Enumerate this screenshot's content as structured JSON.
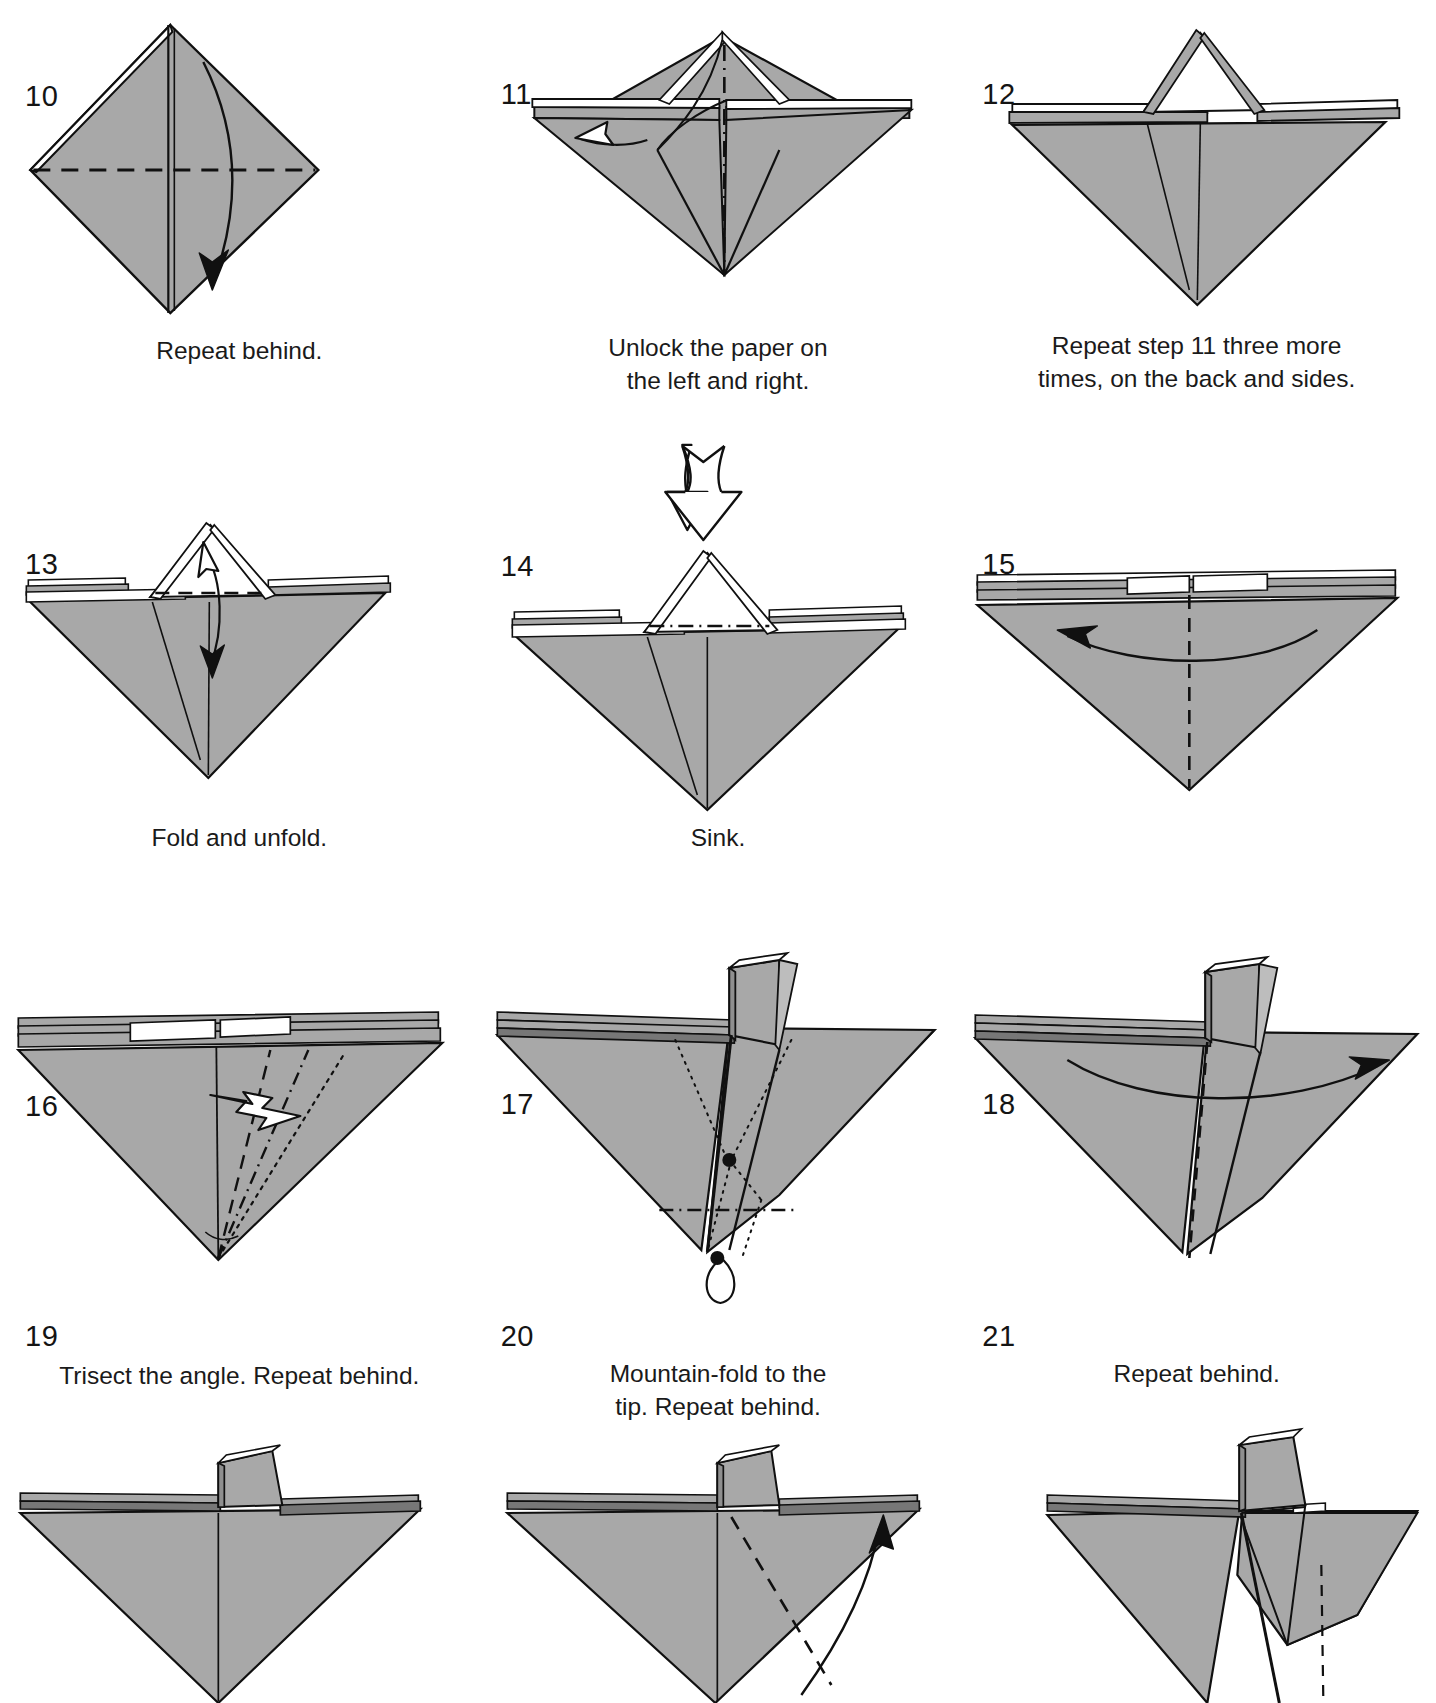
{
  "page": {
    "background": "#ffffff",
    "paper_fill": "#a8a8a8",
    "paper_fill_light": "#bdbdbd",
    "paper_white": "#ffffff",
    "line_color": "#101010",
    "columns": 3
  },
  "steps": [
    {
      "number": "10",
      "caption": "Repeat behind.",
      "diagram": "diamond-kite-with-valley-crease",
      "creases": [
        "horizontal-valley-dashed",
        "vertical-center"
      ],
      "arrows": [
        "curved-arrow-down-right"
      ]
    },
    {
      "number": "11",
      "caption": "Unlock the paper on\nthe left and right.",
      "diagram": "bat-wing-with-open-flap",
      "creases": [
        "vertical-mountain-dashdot"
      ],
      "arrows": [
        "hollow-arrow-left"
      ]
    },
    {
      "number": "12",
      "caption": "Repeat step 11 three more\ntimes, on the back and sides.",
      "diagram": "inverted-triangle-with-tent",
      "creases": [],
      "arrows": []
    },
    {
      "number": "13",
      "caption": "Fold and unfold.",
      "diagram": "inverted-triangle-with-white-tent",
      "creases": [
        "horizontal-valley-dashed-across-tent"
      ],
      "arrows": [
        "double-headed-fold-unfold-arrow"
      ]
    },
    {
      "number": "14",
      "caption": "Sink.",
      "diagram": "inverted-triangle-with-white-tent",
      "creases": [
        "horizontal-mountain-dashdot-across-tent"
      ],
      "arrows": [
        "hollow-push-arrow-down"
      ]
    },
    {
      "number": "15",
      "caption": "",
      "diagram": "flat-inverted-triangle-layered",
      "creases": [
        "vertical-valley-dashed"
      ],
      "arrows": [
        "curved-arrow-left"
      ]
    },
    {
      "number": "16",
      "caption": "Trisect the angle. Repeat behind.",
      "diagram": "flat-inverted-triangle-layered",
      "creases": [
        "trisect-valley-dashed",
        "trisect-mountain-dashdot",
        "trisect-dotted"
      ],
      "arrows": [
        "zigzag-crimp-arrow"
      ]
    },
    {
      "number": "17",
      "caption": "Mountain-fold to the\ntip. Repeat behind.",
      "diagram": "swallow-with-upright-flap",
      "creases": [
        "dotted-hidden-lines",
        "horizontal-mountain-dashdot"
      ],
      "markers": [
        "reference-dot",
        "reference-dot"
      ],
      "arrows": [
        "loop-arrow-at-tip"
      ]
    },
    {
      "number": "18",
      "caption": "Repeat behind.",
      "diagram": "swallow-with-upright-flap",
      "creases": [
        "vertical-valley-dashed"
      ],
      "arrows": [
        "curved-arrow-right"
      ]
    },
    {
      "number": "19",
      "caption": "",
      "diagram": "triangle-with-small-upright-flap",
      "creases": [
        "vertical-center-line"
      ],
      "arrows": []
    },
    {
      "number": "20",
      "caption": "",
      "diagram": "triangle-with-small-upright-flap",
      "creases": [
        "vertical-center-line",
        "diagonal-valley-dashed"
      ],
      "arrows": [
        "curved-arrow-right-lower"
      ]
    },
    {
      "number": "21",
      "caption": "",
      "diagram": "triangle-with-folded-right-flap",
      "creases": [
        "vertical-dashed-right"
      ],
      "arrows": []
    }
  ]
}
